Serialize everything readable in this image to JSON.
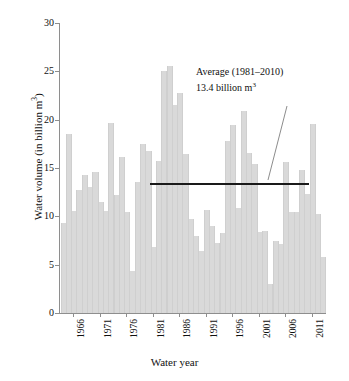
{
  "chart_data": {
    "type": "bar",
    "title": "",
    "xlabel": "Water year",
    "ylabel": "Water volume (in billion m³)",
    "ylabel_text": "Water volume (in billion m",
    "ylabel_sup": "3",
    "ylabel_tail": ")",
    "ylim": [
      0,
      30
    ],
    "ytick_values": [
      0,
      5,
      10,
      15,
      20,
      25,
      30
    ],
    "ytick_labels": [
      "0",
      "5",
      "10",
      "15",
      "20",
      "25",
      "30"
    ],
    "grid": false,
    "legend": "none",
    "xtick_labels": [
      "1966",
      "1971",
      "1976",
      "1981",
      "1986",
      "1991",
      "1996",
      "2001",
      "2006",
      "2011"
    ],
    "xtick_years": [
      1966,
      1971,
      1976,
      1981,
      1986,
      1991,
      1996,
      2001,
      2006,
      2011
    ],
    "x_start_year": 1964,
    "x_end_year": 2013,
    "categories": [
      1964,
      1965,
      1966,
      1967,
      1968,
      1969,
      1970,
      1971,
      1972,
      1973,
      1974,
      1975,
      1976,
      1977,
      1978,
      1979,
      1980,
      1981,
      1982,
      1983,
      1984,
      1985,
      1986,
      1987,
      1988,
      1989,
      1990,
      1991,
      1992,
      1993,
      1994,
      1995,
      1996,
      1997,
      1998,
      1999,
      2000,
      2001,
      2002,
      2003,
      2004,
      2005,
      2006,
      2007,
      2008,
      2009,
      2010,
      2011,
      2012,
      2013
    ],
    "values": [
      9.3,
      18.5,
      10.6,
      12.7,
      14.3,
      13.0,
      14.6,
      11.5,
      10.6,
      19.7,
      12.2,
      16.1,
      10.4,
      4.3,
      13.6,
      17.5,
      16.8,
      6.8,
      15.7,
      25.0,
      25.6,
      21.5,
      22.8,
      16.4,
      9.7,
      8.0,
      6.4,
      10.7,
      9.0,
      7.2,
      8.3,
      17.8,
      19.5,
      10.9,
      20.9,
      16.6,
      15.4,
      8.4,
      8.5,
      3.0,
      7.4,
      7.1,
      15.6,
      10.4,
      10.5,
      14.8,
      12.3,
      19.6,
      10.2,
      5.8
    ],
    "bar_color": "#d9d9d9",
    "average_line": {
      "value": 13.4,
      "color": "#1a1a1a",
      "start_year": 1981,
      "end_year": 2010,
      "label_line1": "Average (1981–2010)",
      "label_line2_text": "13.4 billion m",
      "label_line2_sup": "3"
    }
  },
  "annotation": {
    "line1": "Average (1981–2010)",
    "line2_text": "13.4 billion m",
    "line2_sup": "3"
  },
  "axes": {
    "x_title": "Water year",
    "y_title_text": "Water volume (in billion m",
    "y_title_sup": "3",
    "y_title_tail": ")"
  }
}
